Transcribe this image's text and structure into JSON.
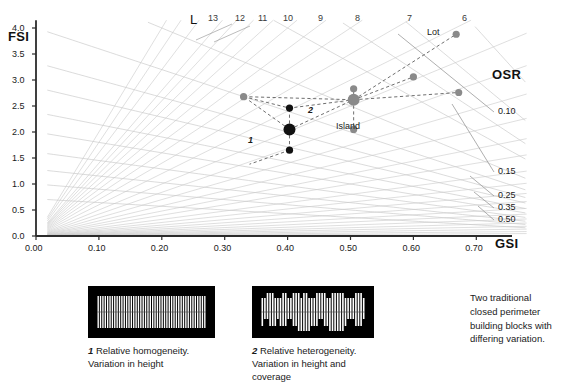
{
  "axes": {
    "y_title": "FSI",
    "x_title": "GSI",
    "y_ticks": [
      "4.0",
      "3.5",
      "3.0",
      "2.5",
      "2.0",
      "1.5",
      "1.0",
      "0.5",
      "0.0"
    ],
    "y_tick_values": [
      4.0,
      3.5,
      3.0,
      2.5,
      2.0,
      1.5,
      1.0,
      0.5,
      0.0
    ],
    "x_ticks": [
      "0.00",
      "0.10",
      "0.20",
      "0.30",
      "0.40",
      "0.50",
      "0.60",
      "0.70"
    ],
    "x_tick_values": [
      0.0,
      0.1,
      0.2,
      0.3,
      0.4,
      0.5,
      0.6,
      0.7
    ],
    "xlim": [
      0.0,
      0.78
    ],
    "ylim": [
      0.0,
      4.15
    ]
  },
  "ridge": {
    "title": "L",
    "labels": [
      "13",
      "12",
      "11",
      "10",
      "9",
      "8",
      "7",
      "6"
    ],
    "values": [
      13,
      12,
      11,
      10,
      9,
      8,
      7,
      6
    ]
  },
  "osr": {
    "title": "OSR",
    "labels": [
      "0.10",
      "0.15",
      "0.25",
      "0.35",
      "0.50"
    ],
    "values": [
      0.1,
      0.15,
      0.25,
      0.35,
      0.5
    ]
  },
  "points": {
    "lot_label": "Lot",
    "island_label": "Island",
    "cluster1_label": "1",
    "cluster2_label": "2"
  },
  "chart_data": {
    "type": "scatter",
    "title": "",
    "xlabel": "GSI",
    "ylabel": "FSI",
    "xlim": [
      0.0,
      0.78
    ],
    "ylim": [
      0.0,
      4.15
    ],
    "grid": false,
    "legend": "none",
    "annotations": [
      "L",
      "OSR",
      "Lot",
      "Island",
      "1",
      "2"
    ],
    "series": [
      {
        "name": "Block type 1 (relative homogeneity)",
        "color": "#111111",
        "marker": "circle",
        "points": [
          {
            "label": "1",
            "x": 0.403,
            "y": 2.05,
            "size": "large"
          },
          {
            "label": "",
            "x": 0.403,
            "y": 2.46,
            "size": "small"
          },
          {
            "label": "",
            "x": 0.403,
            "y": 1.65,
            "size": "small"
          }
        ]
      },
      {
        "name": "Block type 2 (relative heterogeneity)",
        "color": "#8a8a8a",
        "marker": "circle",
        "points": [
          {
            "label": "2",
            "x": 0.505,
            "y": 2.62,
            "size": "large"
          },
          {
            "label": "",
            "x": 0.505,
            "y": 2.83,
            "size": "small"
          },
          {
            "label": "",
            "x": 0.505,
            "y": 2.05,
            "size": "small"
          },
          {
            "label": "",
            "x": 0.33,
            "y": 2.68,
            "size": "small"
          },
          {
            "label": "",
            "x": 0.6,
            "y": 3.06,
            "size": "small"
          },
          {
            "label": "",
            "x": 0.672,
            "y": 2.76,
            "size": "small"
          },
          {
            "label": "Lot",
            "x": 0.668,
            "y": 3.88,
            "size": "small"
          }
        ]
      }
    ],
    "ridge_lines": {
      "name": "L (number of layers)",
      "labels": [
        "13",
        "12",
        "11",
        "10",
        "9",
        "8",
        "7",
        "6"
      ],
      "values": [
        13,
        12,
        11,
        10,
        9,
        8,
        7,
        6
      ]
    },
    "osr_lines": {
      "name": "OSR (open space ratio)",
      "labels": [
        "0.10",
        "0.15",
        "0.25",
        "0.35",
        "0.50"
      ],
      "values": [
        0.1,
        0.15,
        0.25,
        0.35,
        0.5
      ]
    }
  },
  "figures": [
    {
      "number": "1",
      "caption": "Relative homogeneity.\nVariation in height",
      "caption_line1": "Relative homogeneity.",
      "caption_line2": "Variation in height"
    },
    {
      "number": "2",
      "caption": "Relative heterogeneity.\nVariation in height and\ncoverage",
      "caption_line1": "Relative heterogeneity.",
      "caption_line2": "Variation in height and",
      "caption_line3": "coverage"
    }
  ],
  "note": {
    "line1": "Two traditional",
    "line2": "closed perimeter",
    "line3": "building blocks with",
    "line4": "differing variation."
  },
  "colors": {
    "ink": "#1a1a1a",
    "grid": "#b9b9b9",
    "grid_light": "#cccccc",
    "dark_point": "#111111",
    "gray_point": "#8a8a8a",
    "axis": "#2b2b2b"
  }
}
